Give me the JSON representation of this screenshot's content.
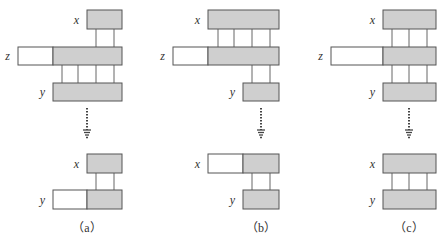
{
  "colors": {
    "shaded": "#cfcfcf",
    "unshaded": "#ffffff",
    "stroke": "#555555",
    "connector": "#666666"
  },
  "panels": [
    {
      "caption": "（a）",
      "top": {
        "x": {
          "label": "x",
          "white": null,
          "gray": [
            87,
            122
          ],
          "y": [
            10,
            29
          ]
        },
        "z": {
          "label": "z",
          "white": [
            18,
            53
          ],
          "gray": [
            53,
            122
          ],
          "y": [
            47,
            65
          ]
        },
        "y": {
          "label": "y",
          "white": null,
          "gray": [
            53,
            122
          ],
          "y": [
            83,
            101
          ]
        },
        "connectors_xz": [
          96,
          114
        ],
        "connectors_zy": [
          62,
          78,
          96,
          114
        ]
      },
      "arrow": {
        "x": 87,
        "y1": 108,
        "y2": 140
      },
      "bottom": {
        "x": {
          "label": "x",
          "white": null,
          "gray": [
            87,
            122
          ],
          "y": [
            154,
            173
          ]
        },
        "y": {
          "label": "y",
          "white": [
            53,
            87
          ],
          "gray": [
            87,
            122
          ],
          "y": [
            190,
            209
          ]
        },
        "connectors": [
          96,
          114
        ]
      },
      "caption_x": 87
    },
    {
      "caption": "（b）",
      "top": {
        "x": {
          "label": "x",
          "white": null,
          "gray": [
            208,
            279
          ],
          "y": [
            10,
            29
          ]
        },
        "z": {
          "label": "z",
          "white": [
            173,
            208
          ],
          "gray": [
            208,
            279
          ],
          "y": [
            47,
            65
          ]
        },
        "y": {
          "label": "y",
          "white": null,
          "gray": [
            243,
            279
          ],
          "y": [
            83,
            101
          ]
        },
        "connectors_xz": [
          218,
          234,
          252,
          270
        ],
        "connectors_zy": [
          252,
          270
        ]
      },
      "arrow": {
        "x": 261,
        "y1": 108,
        "y2": 140
      },
      "bottom": {
        "x": {
          "label": "x",
          "white": [
            208,
            243
          ],
          "gray": [
            243,
            279
          ],
          "y": [
            154,
            173
          ]
        },
        "y": {
          "label": "y",
          "white": null,
          "gray": [
            243,
            279
          ],
          "y": [
            190,
            209
          ]
        },
        "connectors": [
          252,
          270
        ]
      },
      "caption_x": 261
    },
    {
      "caption": "（c）",
      "top": {
        "x": {
          "label": "x",
          "white": null,
          "gray": [
            383,
            436
          ],
          "y": [
            10,
            29
          ]
        },
        "z": {
          "label": "z",
          "white": [
            331,
            383
          ],
          "gray": [
            383,
            436
          ],
          "y": [
            47,
            65
          ]
        },
        "y": {
          "label": "y",
          "white": null,
          "gray": [
            383,
            436
          ],
          "y": [
            83,
            101
          ]
        },
        "connectors_xz": [
          392,
          409,
          427
        ],
        "connectors_zy": [
          392,
          409,
          427
        ]
      },
      "arrow": {
        "x": 409,
        "y1": 108,
        "y2": 140
      },
      "bottom": {
        "x": {
          "label": "x",
          "white": null,
          "gray": [
            383,
            436
          ],
          "y": [
            154,
            173
          ]
        },
        "y": {
          "label": "y",
          "white": null,
          "gray": [
            383,
            436
          ],
          "y": [
            190,
            209
          ]
        },
        "connectors": [
          392,
          409,
          427
        ]
      },
      "caption_x": 409
    }
  ]
}
